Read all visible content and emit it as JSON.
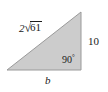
{
  "figure": {
    "type": "right-triangle-diagram",
    "background_color": "#ffffff",
    "fill_color": "#cccccc",
    "stroke_color": "#9a9a9a",
    "text_color": "#1a1a1a",
    "vertices": {
      "bottom_left": [
        7,
        70
      ],
      "bottom_right": [
        81,
        70
      ],
      "top_right": [
        81,
        12
      ]
    },
    "labels": {
      "hypotenuse": {
        "coefficient": "2",
        "radical_sign": "√",
        "radicand": "61",
        "full_text": "2√61"
      },
      "vertical_leg": "10",
      "right_angle": "90",
      "degree_symbol": "°",
      "base": "b"
    }
  }
}
